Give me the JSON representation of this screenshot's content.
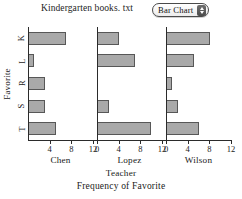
{
  "header": {
    "title": "Kindergarten books. txt",
    "chart_type_label": "Bar  Chart",
    "stepper_icon": "up-down-stepper-icon"
  },
  "chart_data": {
    "type": "bar",
    "title": "Kindergarten books. txt",
    "caption": "Frequency of Favorite",
    "orientation": "horizontal",
    "xlabel": "Teacher",
    "ylabel": "Favorite",
    "grid": false,
    "legend": "none",
    "xlim": [
      0,
      12
    ],
    "xticks": [
      0,
      4,
      8,
      12
    ],
    "xticklabels": [
      "0",
      "4",
      "8",
      "12"
    ],
    "categories": [
      "K",
      "L",
      "R",
      "S",
      "T"
    ],
    "panels": [
      "Chen",
      "Lopez",
      "Wilson"
    ],
    "series": [
      {
        "name": "Chen",
        "values": [
          7,
          1,
          3,
          3,
          5
        ]
      },
      {
        "name": "Lopez",
        "values": [
          4,
          7,
          0,
          2,
          10
        ]
      },
      {
        "name": "Wilson",
        "values": [
          8,
          5,
          1,
          2,
          6
        ]
      }
    ],
    "colors": {
      "bar_fill": "#a9a9a9",
      "bar_edge": "#575757",
      "axis": "#2b2b2b",
      "text": "#1a1a1a",
      "background": "#ffffff"
    }
  }
}
